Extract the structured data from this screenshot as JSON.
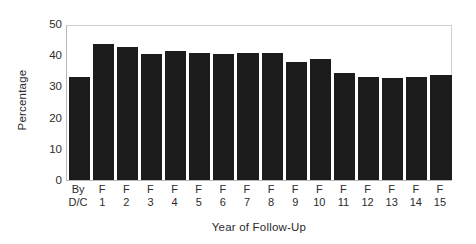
{
  "chart_data": {
    "type": "bar",
    "title": "",
    "xlabel": "Year of Follow-Up",
    "ylabel": "Percentage",
    "categories": [
      "By D/C",
      "F 1",
      "F 2",
      "F 3",
      "F 4",
      "F 5",
      "F 6",
      "F 7",
      "F 8",
      "F 9",
      "F 10",
      "F 11",
      "F 12",
      "F 13",
      "F 14",
      "F 15"
    ],
    "category_lines": [
      [
        "By",
        "D/C"
      ],
      [
        "F",
        "1"
      ],
      [
        "F",
        "2"
      ],
      [
        "F",
        "3"
      ],
      [
        "F",
        "4"
      ],
      [
        "F",
        "5"
      ],
      [
        "F",
        "6"
      ],
      [
        "F",
        "7"
      ],
      [
        "F",
        "8"
      ],
      [
        "F",
        "9"
      ],
      [
        "F",
        "10"
      ],
      [
        "F",
        "11"
      ],
      [
        "F",
        "12"
      ],
      [
        "F",
        "13"
      ],
      [
        "F",
        "14"
      ],
      [
        "F",
        "15"
      ]
    ],
    "values": [
      33,
      43.5,
      42.7,
      40.5,
      41.3,
      40.7,
      40.5,
      40.7,
      40.8,
      37.7,
      38.7,
      34.2,
      33,
      32.7,
      33,
      33.7
    ],
    "ylim": [
      0,
      50
    ],
    "yticks": [
      0,
      10,
      20,
      30,
      40,
      50
    ],
    "ytick_labels": [
      "0",
      "10",
      "20",
      "30",
      "40",
      "50"
    ],
    "grid": false,
    "legend": false,
    "bar_color": "#1c1c1c",
    "background_color": "#ffffff",
    "frame_color": "#b9b9b9"
  }
}
